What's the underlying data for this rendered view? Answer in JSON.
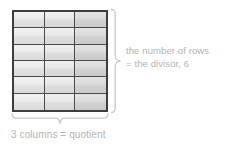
{
  "diagram": {
    "background_color": "#ffffff",
    "grid": {
      "columns": 3,
      "rows": 6,
      "total_cells": 18,
      "line_color": "#4a4a4a",
      "border_color": "#3d3d3d",
      "cell_fill_light": "#ececec",
      "cell_fill_dark": "#d6d6d6"
    },
    "labels": {
      "text_color": "#b3b3b3",
      "rows_line1": "the number of rows",
      "rows_line2": "= the divisor, 6",
      "columns": "3 columns = quotient"
    },
    "braces": {
      "right_brace": "right-curly-brace",
      "bottom_brace": "bottom-curly-brace",
      "color": "#c9c9c9"
    },
    "values": {
      "divisor": "6",
      "quotient": "3"
    }
  }
}
